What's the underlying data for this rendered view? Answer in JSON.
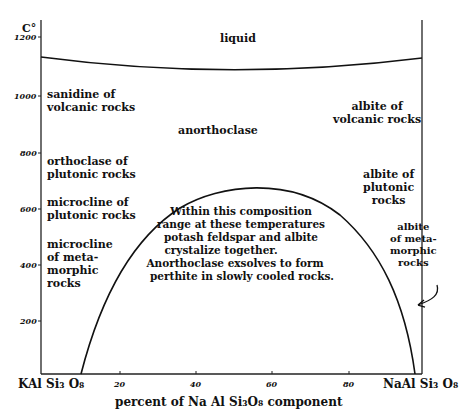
{
  "diagram": {
    "y_axis": {
      "unit": "C°",
      "ticks": [
        "1200",
        "1000",
        "800",
        "600",
        "400",
        "200"
      ]
    },
    "x_axis": {
      "left_end": "KAl Si₃ O₈",
      "right_end": "NaAl Si₃ O₈",
      "ticks": [
        "20",
        "40",
        "60",
        "80"
      ],
      "label": "percent of Na Al Si₃O₈ component"
    },
    "regions": {
      "liquid": "liquid",
      "anorthoclase": "anorthoclase",
      "sanidine": [
        "sanidine of",
        "volcanic rocks"
      ],
      "orthoclase": [
        "orthoclase of",
        "plutonic rocks"
      ],
      "microcline_plutonic": [
        "microcline of",
        "plutonic rocks"
      ],
      "microcline_meta": [
        "microcline",
        "of meta-",
        "morphic",
        "rocks"
      ],
      "albite_volcanic": [
        "albite of",
        "volcanic rocks"
      ],
      "albite_plutonic": [
        "albite of",
        "plutonic",
        "rocks"
      ],
      "albite_meta": [
        "albite",
        "of meta-",
        "morphic",
        "rocks"
      ]
    },
    "solvus_note": [
      "Within this composition",
      "range at these temperatures",
      "potash feldspar and albite",
      "crystalize together.",
      "Anorthoclase exsolves to form",
      "perthite in slowly cooled rocks."
    ]
  }
}
